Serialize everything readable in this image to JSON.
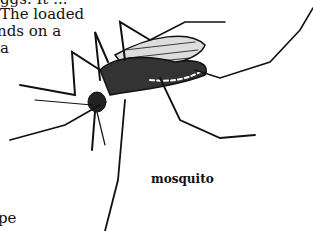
{
  "body_text": {
    "lines": [
      "ggs. It ...",
      "The loaded",
      "nds on a",
      "a"
    ],
    "bottom_fragment": "pe"
  },
  "figure": {
    "caption": "mosquito"
  }
}
